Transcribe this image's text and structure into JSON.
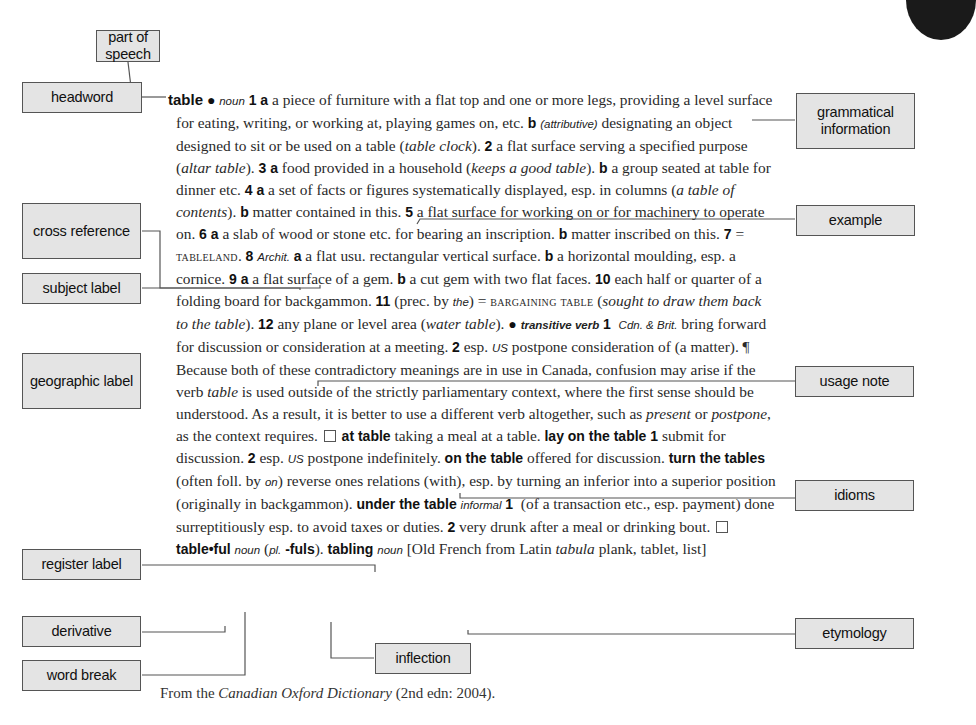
{
  "entry": {
    "headword": "table",
    "bullet": "●",
    "pos_noun": "noun",
    "s1": "1",
    "s1a_label": "a",
    "s1a_text": " a piece of furniture with a flat top and one or more legs, providing a level surface for eating, writing, or working at, playing games on, etc. ",
    "s1b_label": "b",
    "s1b_gram": "(attributive)",
    "s1b_text": " designating an object designed to sit or be used on a table (",
    "s1b_example": "table clock",
    "s1b_end": "). ",
    "s2": "2",
    "s2_text": " a flat surface serving a specified purpose (",
    "s2_example": "altar table",
    "s2_end": "). ",
    "s3": "3",
    "s3a_label": "a",
    "s3a_text": " food provided in a household (",
    "s3a_example": "keeps a good table",
    "s3a_end": "). ",
    "s3b_label": "b",
    "s3b_text": " a group seated at table for dinner etc. ",
    "s4": "4",
    "s4a_label": "a",
    "s4a_text": " a set of facts or figures systematically displayed, esp. in columns (",
    "s4a_example": "a table of contents",
    "s4a_end": "). ",
    "s4b_label": "b",
    "s4b_text": " matter contained in this. ",
    "s5": "5",
    "s5_text": " a flat surface for working on or for machinery to operate on. ",
    "s6": "6",
    "s6a_label": "a",
    "s6a_text": " a slab of wood or stone etc. for bearing an inscription. ",
    "s6b_label": "b",
    "s6b_text": " matter inscribed on this. ",
    "s7": "7",
    "s7_eq": " = ",
    "s7_xref": "tableland",
    "s7_end": ". ",
    "s8": "8",
    "s8_subject": "Archit.",
    "s8a_label": "a",
    "s8a_text": " a flat usu. rectangular vertical surface. ",
    "s8b_label": "b",
    "s8b_text": " a horizontal moulding, esp. a cornice. ",
    "s9": "9",
    "s9a_label": "a",
    "s9a_text": " a flat surface of a gem. ",
    "s9b_label": "b",
    "s9b_text": " a cut gem with two flat faces. ",
    "s10": "10",
    "s10_text": " each half or quarter of a folding board for backgammon. ",
    "s11": "11",
    "s11_pre": " (prec. by ",
    "s11_the": "the",
    "s11_post": ") = ",
    "s11_xref": "bargaining table",
    "s11_open": " (",
    "s11_example": "sought to draw them back to the table",
    "s11_end": "). ",
    "s12": "12",
    "s12_text": " any plane or level area (",
    "s12_example": "water table",
    "s12_end": "). ",
    "pos_verb": "transitive verb",
    "v1": "1",
    "v1_geo": "Cdn. & Brit.",
    "v1_text": " bring forward for discussion or consideration at a meeting. ",
    "v2": "2",
    "v2_pre": " esp. ",
    "v2_geo": "US",
    "v2_text": " postpone consideration of (a matter). ",
    "usage_mark": "¶",
    "usage_1": " Because both of these contradictory meanings are in use in Canada, confusion may arise if the verb ",
    "usage_table": "table",
    "usage_2": " is used outside of the strictly parliamentary context, where the first sense should be understood. As a result, it is better to use a different verb altogether, such as ",
    "usage_present": "present",
    "usage_or": " or ",
    "usage_postpone": "postpone",
    "usage_3": ", as the context requires. ",
    "idiom1_a": "at ",
    "idiom1_b": "table",
    "idiom1_text": " taking a meal at a table. ",
    "idiom2": "lay on the table",
    "idiom2_1": " 1",
    "idiom2_1_text": " submit for discussion. ",
    "idiom2_2": "2",
    "idiom2_2_pre": " esp. ",
    "idiom2_2_geo": "US",
    "idiom2_2_text": " postpone indefinitely. ",
    "idiom3": "on the table",
    "idiom3_text": " offered for discussion. ",
    "idiom4": "turn the tables",
    "idiom4_pre": " (often foll. by ",
    "idiom4_on": "on",
    "idiom4_text": ") reverse ones relations (with), esp. by turning an inferior into a superior position (originally in backgammon). ",
    "idiom5": "under the table",
    "idiom5_register": "informal",
    "idiom5_1": "1",
    "idiom5_1_text": " (of a transaction etc., esp. payment) done surreptitiously esp. to avoid taxes or duties. ",
    "idiom5_2": "2",
    "idiom5_2_text": " very drunk after a meal or drinking bout. ",
    "deriv1": "table•ful",
    "deriv1_pos": "noun",
    "deriv1_open": " (",
    "deriv1_pl": "pl.",
    "deriv1_infl": "-fuls",
    "deriv1_end": "). ",
    "deriv2": "tabling",
    "deriv2_pos": "noun",
    "etym_1": " [Old French from Latin ",
    "etym_latin": "tabula",
    "etym_2": " plank, tablet, list]"
  },
  "callouts": {
    "part_of_speech": "part of speech",
    "headword": "headword",
    "grammatical_information": "grammatical information",
    "cross_reference": "cross reference",
    "example": "example",
    "subject_label": "subject label",
    "geographic_label": "geographic label",
    "usage_note": "usage note",
    "idioms": "idioms",
    "register_label": "register label",
    "derivative": "derivative",
    "etymology": "etymology",
    "word_break": "word break",
    "inflection": "inflection"
  },
  "source": {
    "pre": "From the ",
    "title": "Canadian Oxford Dictionary",
    "post": " (2nd edn: 2004)."
  }
}
